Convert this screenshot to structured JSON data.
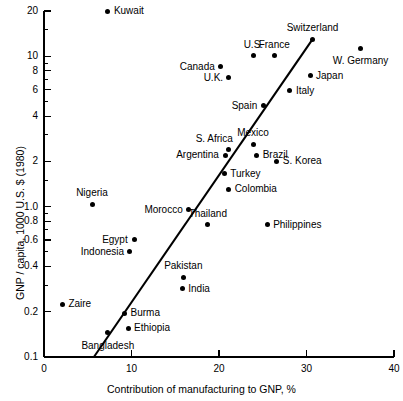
{
  "chart_data": {
    "type": "scatter",
    "title": "",
    "xlabel": "Contribution of manufacturing to GNP, %",
    "ylabel": "GNP / capita, 1000 U.S. $ (1980)",
    "xlim": [
      0,
      40
    ],
    "ylim": [
      0.1,
      20
    ],
    "yscale": "log",
    "xscale": "linear",
    "grid": false,
    "legend": null,
    "xticks": [
      "0",
      "10",
      "20",
      "30",
      "40"
    ],
    "xtick_values": [
      0,
      10,
      20,
      30,
      40
    ],
    "yticks": [
      "20",
      "10",
      "8",
      "6",
      "4",
      "2",
      "1.0",
      "0.8",
      "0.6",
      "0.4",
      "0.2",
      "0.1"
    ],
    "ytick_values": [
      20,
      10,
      8,
      6,
      4,
      2,
      1.0,
      0.8,
      0.6,
      0.4,
      0.2,
      0.1
    ],
    "yminor_values": [
      15,
      3,
      5,
      7,
      9,
      0.3,
      0.5,
      0.7,
      0.9,
      1.5
    ],
    "trendline": {
      "x1": 5.7,
      "y1": 0.1,
      "x2": 30.7,
      "y2": 13.0
    },
    "points": [
      {
        "label": "Kuwait",
        "x": 7.3,
        "y": 20.0,
        "label_pos": "right"
      },
      {
        "label": "Switzerland",
        "x": 30.7,
        "y": 13.0,
        "label_pos": "above"
      },
      {
        "label": "W. Germany",
        "x": 36.2,
        "y": 11.3,
        "label_pos": "below"
      },
      {
        "label": "U.S.",
        "x": 23.9,
        "y": 10.1,
        "label_pos": "above"
      },
      {
        "label": "France",
        "x": 26.3,
        "y": 10.1,
        "label_pos": "above"
      },
      {
        "label": "Canada",
        "x": 20.2,
        "y": 8.5,
        "label_pos": "left"
      },
      {
        "label": "Japan",
        "x": 30.4,
        "y": 7.4,
        "label_pos": "right"
      },
      {
        "label": "U.K.",
        "x": 21.1,
        "y": 7.2,
        "label_pos": "left"
      },
      {
        "label": "Italy",
        "x": 28.1,
        "y": 5.9,
        "label_pos": "right"
      },
      {
        "label": "Spain",
        "x": 25.1,
        "y": 4.7,
        "label_pos": "left"
      },
      {
        "label": "Mexico",
        "x": 23.9,
        "y": 2.6,
        "label_pos": "above"
      },
      {
        "label": "S. Africa",
        "x": 21.1,
        "y": 2.4,
        "label_pos": "above-left"
      },
      {
        "label": "Brazil",
        "x": 24.3,
        "y": 2.2,
        "label_pos": "right"
      },
      {
        "label": "Argentina",
        "x": 20.7,
        "y": 2.2,
        "label_pos": "left"
      },
      {
        "label": "S. Korea",
        "x": 26.6,
        "y": 2.0,
        "label_pos": "right"
      },
      {
        "label": "Turkey",
        "x": 20.6,
        "y": 1.65,
        "label_pos": "right"
      },
      {
        "label": "Colombia",
        "x": 21.1,
        "y": 1.3,
        "label_pos": "right"
      },
      {
        "label": "Nigeria",
        "x": 5.5,
        "y": 1.04,
        "label_pos": "above"
      },
      {
        "label": "Morocco",
        "x": 16.5,
        "y": 0.95,
        "label_pos": "left"
      },
      {
        "label": "Thailand",
        "x": 18.7,
        "y": 0.76,
        "label_pos": "above"
      },
      {
        "label": "Philippines",
        "x": 25.5,
        "y": 0.76,
        "label_pos": "right"
      },
      {
        "label": "Egypt",
        "x": 10.3,
        "y": 0.6,
        "label_pos": "left"
      },
      {
        "label": "Indonesia",
        "x": 9.8,
        "y": 0.5,
        "label_pos": "left"
      },
      {
        "label": "Pakistan",
        "x": 15.9,
        "y": 0.34,
        "label_pos": "above"
      },
      {
        "label": "India",
        "x": 15.8,
        "y": 0.285,
        "label_pos": "right"
      },
      {
        "label": "Zaire",
        "x": 2.1,
        "y": 0.225,
        "label_pos": "right"
      },
      {
        "label": "Burma",
        "x": 9.2,
        "y": 0.195,
        "label_pos": "right"
      },
      {
        "label": "Ethiopia",
        "x": 9.6,
        "y": 0.155,
        "label_pos": "right"
      },
      {
        "label": "Bangladesh",
        "x": 7.3,
        "y": 0.145,
        "label_pos": "below"
      }
    ]
  }
}
